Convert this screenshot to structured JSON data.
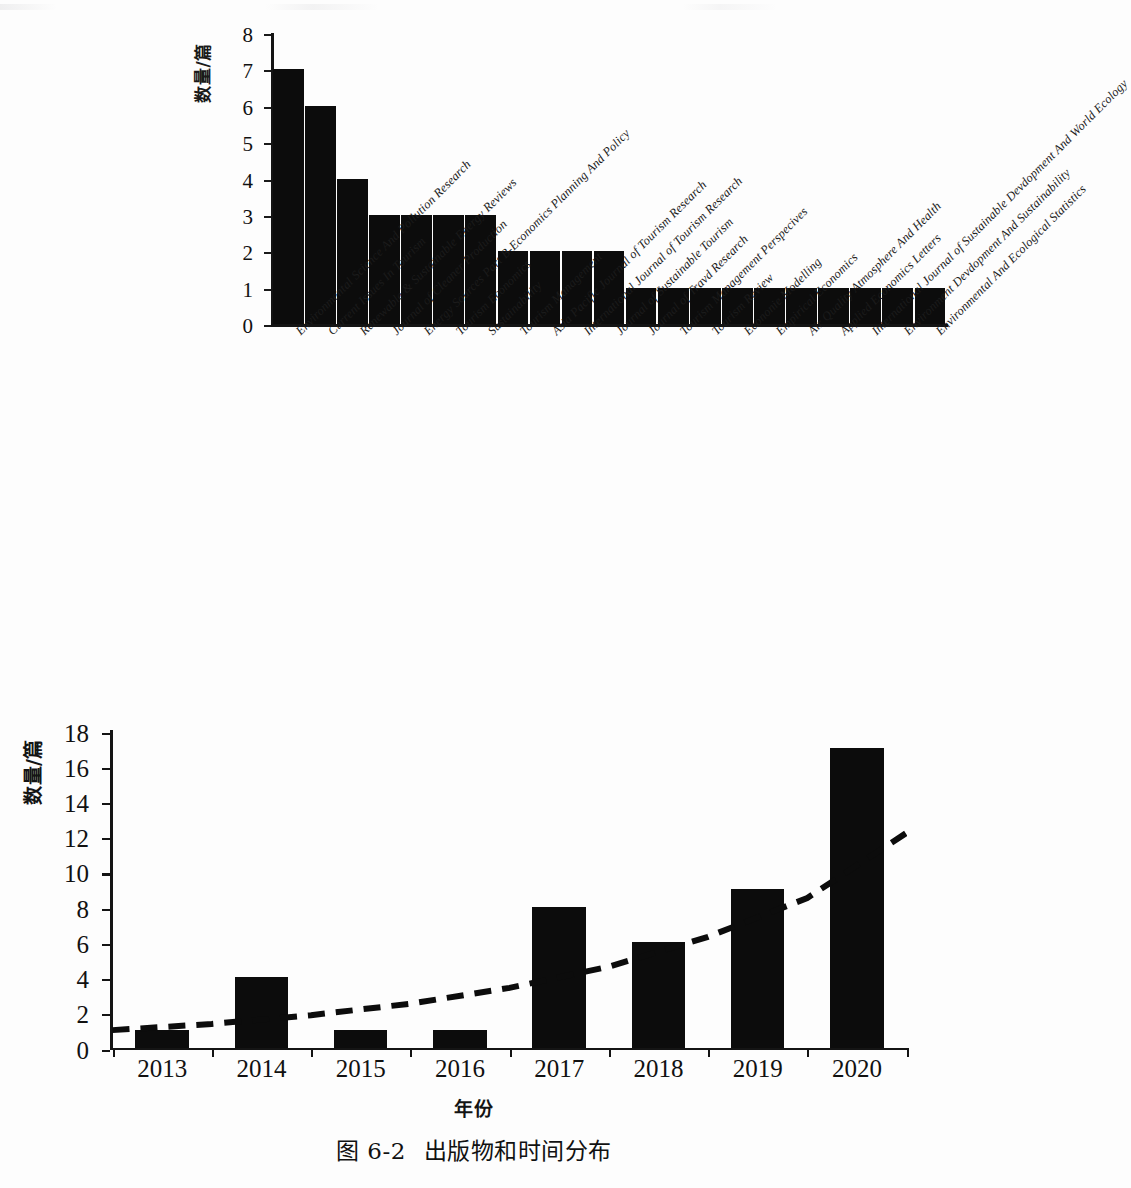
{
  "figure": {
    "caption_number": "图 6-2",
    "caption_text": "出版物和时间分布"
  },
  "chart_data": [
    {
      "type": "bar",
      "id": "journal-distribution",
      "title": "",
      "xlabel": "",
      "ylabel": "数量/篇",
      "ylim": [
        0,
        8
      ],
      "yticks": [
        "0",
        "1",
        "2",
        "3",
        "4",
        "5",
        "6",
        "7",
        "8"
      ],
      "grid": false,
      "legend": "none",
      "categories": [
        "Environmental Science And Pollution Research",
        "Current Issues In Tourism",
        "Renewable & Sustainable Energy Reviews",
        "Journal of Cleaner Production",
        "Energy Sources Part B-Economics Planning And Policy",
        "Tourism Economics",
        "Sustainability",
        "Tourism Management",
        "Asia Paciflc Journal of Tourism Research",
        "International Journal of Tourism Research",
        "Journal of Sustainable Tourism",
        "Journal of Travd Research",
        "Tourism Management Perspecives",
        "Tourism Review",
        "Econonie Modelling",
        "Empirical Economics",
        "Air Quality Atmosphere And Health",
        "Applied Economics Letters",
        "International Journal of Sustainable Devdopment And World Ecology",
        "Environment Devdopment And Sustainability",
        "Environmental And Ecological Statistics"
      ],
      "values": [
        7,
        6,
        4,
        3,
        3,
        3,
        3,
        2,
        2,
        2,
        2,
        1,
        1,
        1,
        1,
        1,
        1,
        1,
        1,
        1,
        1
      ],
      "bar_color": "#0c0c0c"
    },
    {
      "type": "bar",
      "id": "year-distribution",
      "title": "",
      "xlabel": "年份",
      "ylabel": "数量/篇",
      "ylim": [
        0,
        18
      ],
      "yticks": [
        "0",
        "2",
        "4",
        "6",
        "8",
        "10",
        "12",
        "14",
        "16",
        "18"
      ],
      "grid": false,
      "legend": "none",
      "categories": [
        "2013",
        "2014",
        "2015",
        "2016",
        "2017",
        "2018",
        "2019",
        "2020"
      ],
      "values": [
        1,
        4,
        1,
        1,
        8,
        6,
        9,
        17
      ],
      "bar_color": "#0c0c0c",
      "series": [
        {
          "name": "trendline",
          "style": "dashed",
          "color": "#0c0c0c",
          "values": [
            1.1,
            1.45,
            1.95,
            2.6,
            3.5,
            4.7,
            6.4,
            8.6,
            12.3
          ]
        }
      ]
    }
  ]
}
